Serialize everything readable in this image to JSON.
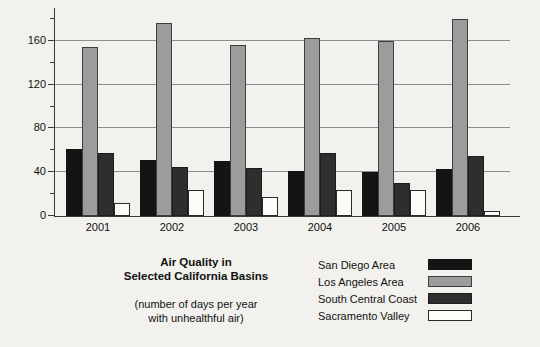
{
  "chart_data": {
    "type": "bar",
    "title": "Air Quality in Selected California Basins",
    "title_line1": "Air Quality in",
    "title_line2": "Selected California Basins",
    "subtitle": "(number of days per year with unhealthful air)",
    "subtitle_line1": "(number of days per year",
    "subtitle_line2": "with unhealthful air)",
    "xlabel": "",
    "ylabel": "",
    "categories": [
      "2001",
      "2002",
      "2003",
      "2004",
      "2005",
      "2006"
    ],
    "ylim": [
      0,
      190
    ],
    "yticks_major": [
      0,
      40,
      80,
      120,
      160
    ],
    "yticks_minor": [
      20,
      60,
      100,
      140,
      180
    ],
    "ytick_labels": [
      "0",
      "40",
      "80",
      "120",
      "160"
    ],
    "grid": true,
    "legend_position": "bottom-right",
    "series": [
      {
        "name": "San Diego Area",
        "color": "#141414",
        "values": [
          61,
          51,
          50,
          41,
          40,
          43
        ]
      },
      {
        "name": "Los Angeles Area",
        "color": "#9c9c9c",
        "values": [
          154,
          176,
          156,
          163,
          160,
          180
        ]
      },
      {
        "name": "South Central Coast",
        "color": "#2e2e2e",
        "values": [
          58,
          45,
          44,
          58,
          30,
          55
        ]
      },
      {
        "name": "Sacramento Valley",
        "color": "#fbfbf8",
        "values": [
          12,
          24,
          17,
          24,
          24,
          5
        ]
      }
    ]
  }
}
